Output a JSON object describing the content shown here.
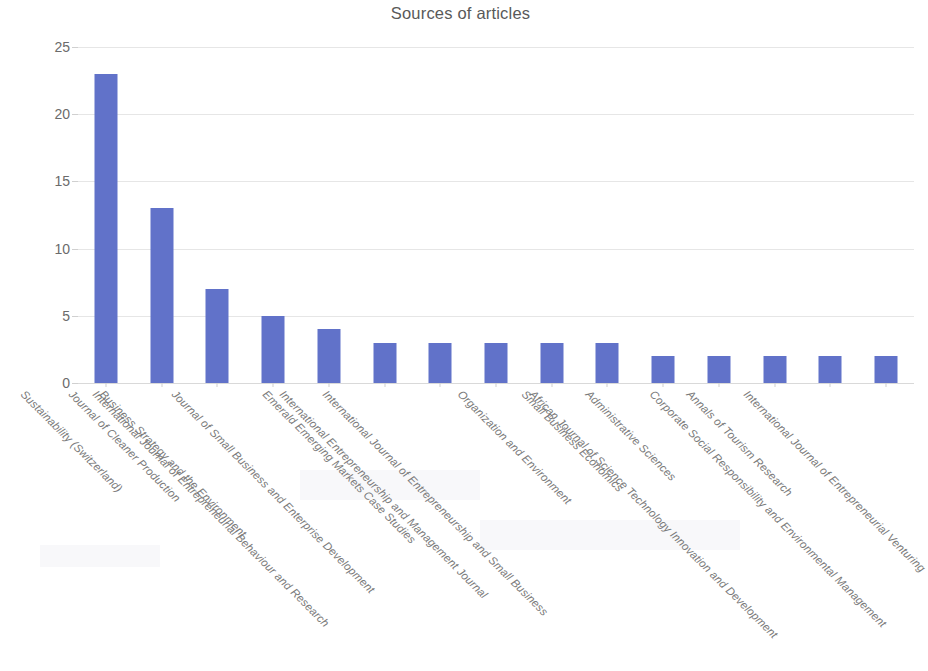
{
  "chart_data": {
    "type": "bar",
    "title": "Sources of articles",
    "xlabel": "",
    "ylabel": "",
    "ylim": [
      0,
      25
    ],
    "yticks": [
      0,
      5,
      10,
      15,
      20,
      25
    ],
    "grid": true,
    "legend": false,
    "orientation": "vertical",
    "bar_color": "#6172c9",
    "categories": [
      "Sustainability (Switzerland)",
      "Journal of Cleaner Production",
      "Business Strategy and the Environment",
      "International Journal of Entrepreneurial Behaviour and Research",
      "Journal of Small Business and Enterprise Development",
      "Emerald Emerging Markets Case Studies",
      "International Entrepreneurship and Management Journal",
      "International Journal of Entrepreneurship and Small Business",
      "Organization and Environment",
      "Small Business Economics",
      "Administrative Sciences",
      "African Journal of Science Technology Innovation and Development",
      "Annals of Tourism Research",
      "Corporate Social Responsibility and Environmental Management",
      "International Journal of Entrepreneurial Venturing"
    ],
    "values": [
      23,
      13,
      7,
      5,
      4,
      3,
      3,
      3,
      3,
      3,
      2,
      2,
      2,
      2,
      2
    ]
  }
}
